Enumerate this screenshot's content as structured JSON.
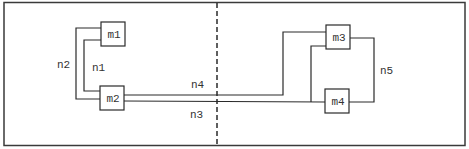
{
  "diagram": {
    "type": "netlist-partition",
    "modules": [
      {
        "id": "m1",
        "label": "m1"
      },
      {
        "id": "m2",
        "label": "m2"
      },
      {
        "id": "m3",
        "label": "m3"
      },
      {
        "id": "m4",
        "label": "m4"
      }
    ],
    "nets": [
      {
        "id": "n1",
        "label": "n1",
        "connects": [
          "m1",
          "m2"
        ]
      },
      {
        "id": "n2",
        "label": "n2",
        "connects": [
          "m1",
          "m2"
        ]
      },
      {
        "id": "n3",
        "label": "n3",
        "connects": [
          "m2",
          "m3",
          "m4"
        ]
      },
      {
        "id": "n4",
        "label": "n4",
        "connects": [
          "m2",
          "m3"
        ]
      },
      {
        "id": "n5",
        "label": "n5",
        "connects": [
          "m3",
          "m4"
        ]
      }
    ],
    "partition": {
      "style": "dashed vertical cut line"
    }
  }
}
